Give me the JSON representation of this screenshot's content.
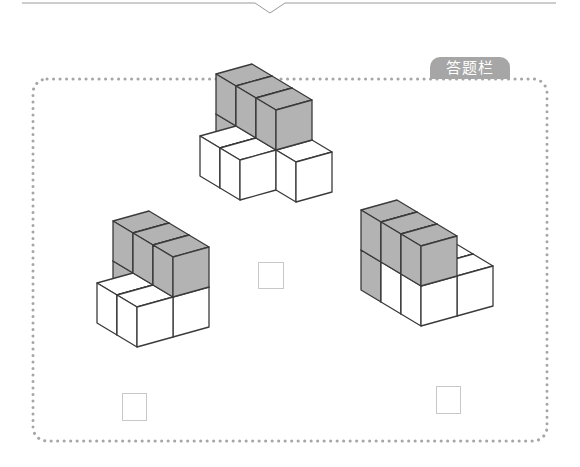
{
  "answer_panel": {
    "title": "答题栏",
    "border_color": "#a6a6a6",
    "tab_color": "#a6a6a6"
  },
  "colors": {
    "gray_face": "#b3b3b3",
    "white_face": "#ffffff",
    "edge": "#3a3a3a"
  },
  "figures": [
    {
      "name": "figure-top",
      "origin": [
        216,
        154
      ],
      "cubes": [
        {
          "u": 0,
          "v": 0,
          "w": 0,
          "color": "gray"
        },
        {
          "u": 0,
          "v": 0,
          "w": 1,
          "color": "gray"
        },
        {
          "u": 1,
          "v": 0,
          "w": 1,
          "color": "gray"
        },
        {
          "u": 2,
          "v": 0,
          "w": 1,
          "color": "gray"
        },
        {
          "u": 1,
          "v": 0,
          "w": 0,
          "color": "gray"
        },
        {
          "u": 2,
          "v": 0,
          "w": 0,
          "color": "gray"
        },
        {
          "u": 1,
          "v": -1,
          "w": 0,
          "color": "white"
        },
        {
          "u": 2,
          "v": -1,
          "w": 0,
          "color": "white"
        },
        {
          "u": 3,
          "v": 0,
          "w": 0,
          "color": "white"
        }
      ],
      "answer_box": {
        "x": 258,
        "y": 262,
        "w": 26,
        "h": 27,
        "value": ""
      }
    },
    {
      "name": "figure-bottom-left",
      "origin": [
        113,
        301
      ],
      "cubes": [
        {
          "u": 0,
          "v": 0,
          "w": 0,
          "color": "gray"
        },
        {
          "u": 0,
          "v": 0,
          "w": 1,
          "color": "gray"
        },
        {
          "u": 1,
          "v": 0,
          "w": 1,
          "color": "gray"
        },
        {
          "u": 2,
          "v": 0,
          "w": 1,
          "color": "gray"
        },
        {
          "u": 1,
          "v": 0,
          "w": 0,
          "color": "gray"
        },
        {
          "u": 2,
          "v": 0,
          "w": 0,
          "color": "white"
        },
        {
          "u": 1,
          "v": -1,
          "w": 0,
          "color": "white"
        },
        {
          "u": 2,
          "v": -1,
          "w": 0,
          "color": "white"
        }
      ],
      "answer_box": {
        "x": 122,
        "y": 393,
        "w": 25,
        "h": 28,
        "value": ""
      }
    },
    {
      "name": "figure-bottom-right",
      "origin": [
        361,
        290
      ],
      "cubes": [
        {
          "u": 0,
          "v": 0,
          "w": 0,
          "color": "gray"
        },
        {
          "u": 0,
          "v": 0,
          "w": 1,
          "color": "gray"
        },
        {
          "u": 1,
          "v": 0,
          "w": 1,
          "color": "gray"
        },
        {
          "u": 2,
          "v": 0,
          "w": 1,
          "color": "gray"
        },
        {
          "u": 1,
          "v": 0,
          "w": 0,
          "color": "white"
        },
        {
          "u": 2,
          "v": 0,
          "w": 0,
          "color": "white"
        },
        {
          "u": 1,
          "v": 1,
          "w": 0,
          "color": "white"
        },
        {
          "u": 2,
          "v": 1,
          "w": 0,
          "color": "white"
        }
      ],
      "answer_box": {
        "x": 436,
        "y": 386,
        "w": 25,
        "h": 28,
        "value": ""
      }
    }
  ]
}
